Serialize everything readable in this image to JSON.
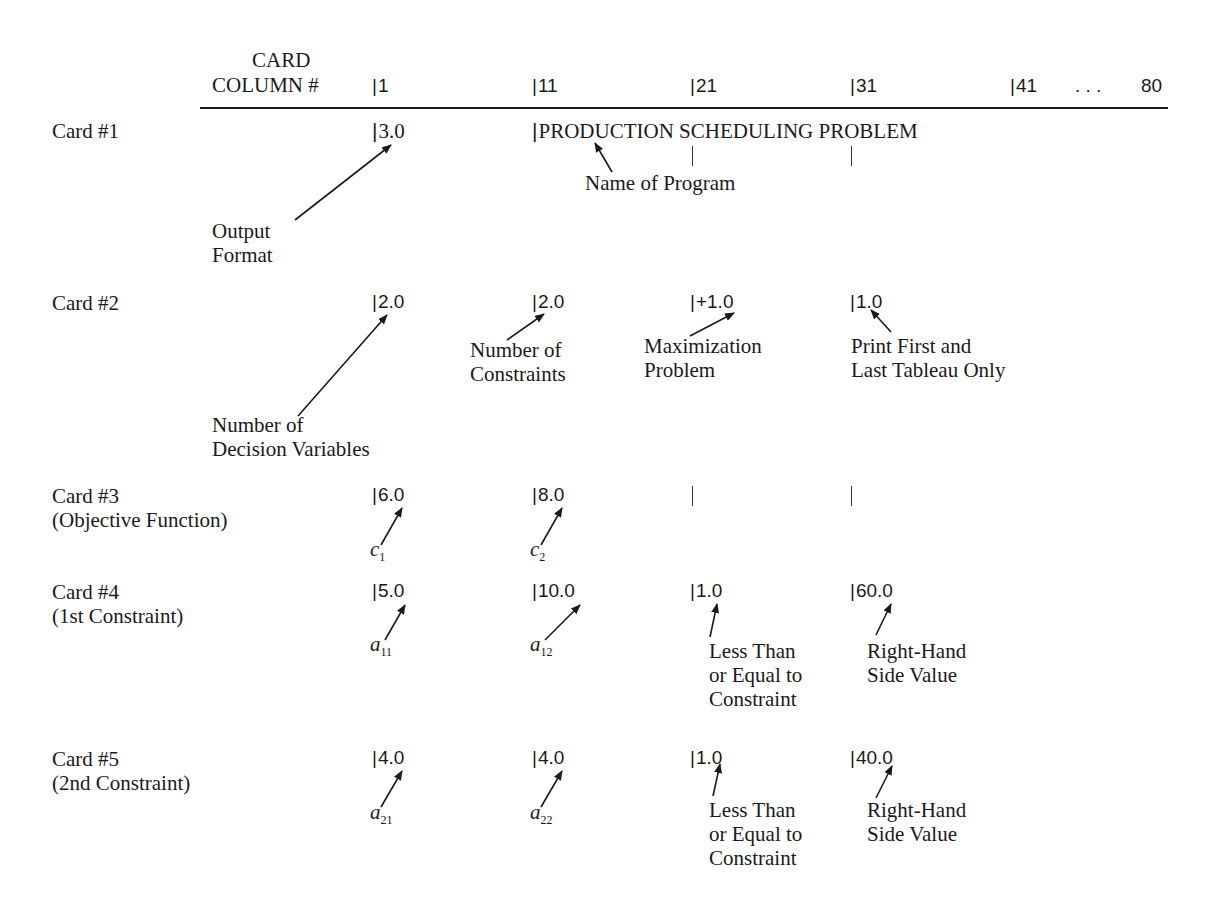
{
  "header": {
    "card_label": "CARD",
    "column_label": "COLUMN #",
    "columns": [
      "1",
      "11",
      "21",
      "31",
      "41"
    ],
    "ellipsis": ". . .",
    "last_column": "80"
  },
  "cards": [
    {
      "label": "Card #1",
      "fields": {
        "col1": "3.0",
        "col11": "PRODUCTION SCHEDULING PROBLEM"
      },
      "annotations": {
        "col1": [
          "Output",
          "Format"
        ],
        "col11": "Name of Program"
      }
    },
    {
      "label": "Card #2",
      "fields": {
        "col1": "2.0",
        "col11": "2.0",
        "col21": "+1.0",
        "col31": "1.0"
      },
      "annotations": {
        "col1": [
          "Number of",
          "Decision Variables"
        ],
        "col11": [
          "Number of",
          "Constraints"
        ],
        "col21": [
          "Maximization",
          "Problem"
        ],
        "col31": [
          "Print First and",
          "Last Tableau Only"
        ]
      }
    },
    {
      "label": "Card #3",
      "sublabel": "(Objective Function)",
      "fields": {
        "col1": "6.0",
        "col11": "8.0"
      },
      "annotations": {
        "col1": {
          "sym": "c",
          "sub": "1"
        },
        "col11": {
          "sym": "c",
          "sub": "2"
        }
      }
    },
    {
      "label": "Card #4",
      "sublabel": "(1st Constraint)",
      "fields": {
        "col1": "5.0",
        "col11": "10.0",
        "col21": "1.0",
        "col31": "60.0"
      },
      "annotations": {
        "col1": {
          "sym": "a",
          "sub": "11"
        },
        "col11": {
          "sym": "a",
          "sub": "12"
        },
        "col21": [
          "Less Than",
          "or Equal to",
          "Constraint"
        ],
        "col31": [
          "Right-Hand",
          "Side Value"
        ]
      }
    },
    {
      "label": "Card #5",
      "sublabel": "(2nd Constraint)",
      "fields": {
        "col1": "4.0",
        "col11": "4.0",
        "col21": "1.0",
        "col31": "40.0"
      },
      "annotations": {
        "col1": {
          "sym": "a",
          "sub": "21"
        },
        "col11": {
          "sym": "a",
          "sub": "22"
        },
        "col21": [
          "Less Than",
          "or Equal to",
          "Constraint"
        ],
        "col31": [
          "Right-Hand",
          "Side Value"
        ]
      }
    }
  ]
}
